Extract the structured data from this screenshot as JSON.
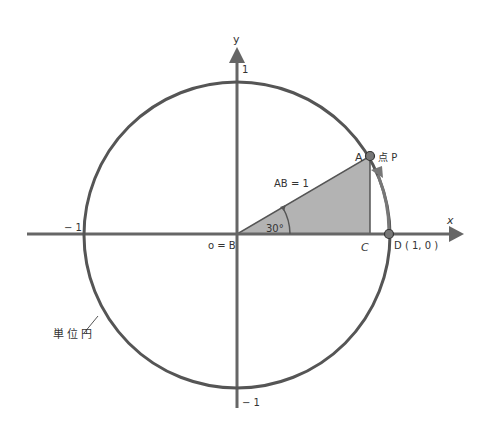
{
  "diagram": {
    "type": "unit-circle",
    "colors": {
      "stroke": "#555555",
      "axis": "#666666",
      "fill": "#b0b0b0",
      "point_fill": "#666666",
      "text": "#333333",
      "background": "#ffffff"
    },
    "axes": {
      "x_label": "x",
      "y_label": "y",
      "ticks": {
        "x_neg": "− 1",
        "y_pos": "1",
        "y_neg": "− 1"
      }
    },
    "labels": {
      "origin": "o = B",
      "point_a": "A",
      "point_p": "点 P",
      "point_c": "C",
      "point_d": "D ( 1,  0 )",
      "hypotenuse": "AB = 1",
      "angle": "30°",
      "circle": "単位円"
    },
    "geometry": {
      "angle_deg": 30,
      "radius": 1,
      "point_d": [
        1,
        0
      ],
      "point_a": [
        0.866,
        0.5
      ]
    }
  }
}
